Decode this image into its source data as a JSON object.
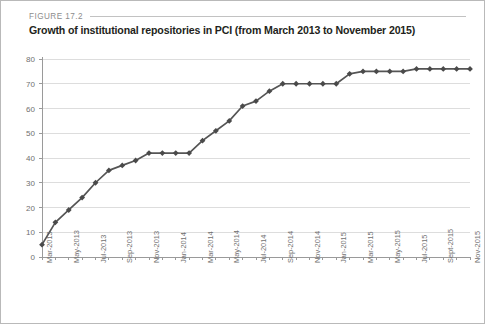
{
  "figure": {
    "label": "FIGURE 17.2",
    "title": "Growth of institutional repositories in PCI (from March 2013 to November 2015)"
  },
  "chart_data": {
    "type": "line",
    "title": "Growth of institutional repositories in PCI (from March 2013 to November 2015)",
    "xlabel": "",
    "ylabel": "",
    "ylim": [
      0,
      80
    ],
    "ytick_step": 10,
    "yticks": [
      0,
      10,
      20,
      30,
      40,
      50,
      60,
      70,
      80
    ],
    "grid": "horizontal",
    "legend": "none",
    "marker": "diamond",
    "line_color": "#555555",
    "marker_color": "#4a4a4a",
    "gridline_color": "#dddddd",
    "axis_color": "#9a9a9a",
    "categories": [
      "Mar-2013",
      "Apr-2013",
      "May-2013",
      "Jun-2013",
      "Jul-2013",
      "Aug-2013",
      "Sep-2013",
      "Oct-2013",
      "Nov-2013",
      "Dec-2013",
      "Jan-2014",
      "Feb-2014",
      "Mar-2014",
      "Apr-2014",
      "May-2014",
      "Jun-2014",
      "Jul-2014",
      "Aug-2014",
      "Sep-2014",
      "Oct-2014",
      "Nov-2014",
      "Dec-2014",
      "Jan-2015",
      "Feb-2015",
      "Mar-2015",
      "Apr-2015",
      "May-2015",
      "Jun-2015",
      "Jul-2015",
      "Aug-2015",
      "Sept-2015",
      "Oct-2015",
      "Nov-2015"
    ],
    "xtick_labels": [
      "Mar-2013",
      "",
      "May-2013",
      "",
      "Jul-2013",
      "",
      "Sep-2013",
      "",
      "Nov-2013",
      "",
      "Jan-2014",
      "",
      "Mar-2014",
      "",
      "May-2014",
      "",
      "Jul-2014",
      "",
      "Sep-2014",
      "",
      "Nov-2014",
      "",
      "Jan-2015",
      "",
      "Mar-2015",
      "",
      "May-2015",
      "",
      "Jul-2015",
      "",
      "Sept-2015",
      "",
      "Nov-2015"
    ],
    "values": [
      5,
      14,
      19,
      24,
      30,
      35,
      37,
      39,
      42,
      42,
      42,
      42,
      47,
      51,
      55,
      61,
      63,
      67,
      70,
      70,
      70,
      70,
      70,
      74,
      75,
      75,
      75,
      75,
      76,
      76,
      76,
      76,
      76
    ]
  }
}
